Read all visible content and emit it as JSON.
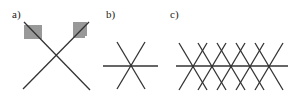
{
  "diagram": {
    "line_color": "#333333",
    "background": "#ffffff",
    "panels": [
      {
        "label": "a)",
        "description": "Two crossing lines forming an X, with a horizontally hatched box at the upper-left end and a vertically hatched box at the upper-right end"
      },
      {
        "label": "b)",
        "description": "Three lines crossing at a single point: one horizontal and two diagonals (six-pointed star)"
      },
      {
        "label": "c)",
        "description": "Horizontal line with five evenly spaced crossing points where pairs of diagonal lines intersect, forming a zigzag lattice"
      }
    ]
  }
}
